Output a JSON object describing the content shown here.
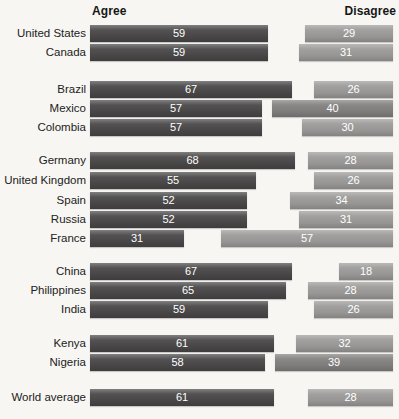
{
  "header": {
    "agree_label": "Agree",
    "disagree_label": "Disagree"
  },
  "chart_data": {
    "type": "bar",
    "orientation": "horizontal-paired",
    "unit": "percent",
    "x_max": 100,
    "legend_position": "top (column headers)",
    "grid": "off",
    "series_names": [
      "Agree",
      "Disagree"
    ],
    "groups": [
      {
        "rows": [
          {
            "label": "United States",
            "agree": 59,
            "disagree": 29,
            "disagree_dark": false
          },
          {
            "label": "Canada",
            "agree": 59,
            "disagree": 31,
            "disagree_dark": false
          }
        ]
      },
      {
        "rows": [
          {
            "label": "Brazil",
            "agree": 67,
            "disagree": 26,
            "disagree_dark": false
          },
          {
            "label": "Mexico",
            "agree": 57,
            "disagree": 40,
            "disagree_dark": true
          },
          {
            "label": "Colombia",
            "agree": 57,
            "disagree": 30,
            "disagree_dark": false
          }
        ]
      },
      {
        "rows": [
          {
            "label": "Germany",
            "agree": 68,
            "disagree": 28,
            "disagree_dark": false
          },
          {
            "label": "United Kingdom",
            "agree": 55,
            "disagree": 26,
            "disagree_dark": false
          },
          {
            "label": "Spain",
            "agree": 52,
            "disagree": 34,
            "disagree_dark": false
          },
          {
            "label": "Russia",
            "agree": 52,
            "disagree": 31,
            "disagree_dark": false
          },
          {
            "label": "France",
            "agree": 31,
            "disagree": 57,
            "disagree_dark": false
          }
        ]
      },
      {
        "rows": [
          {
            "label": "China",
            "agree": 67,
            "disagree": 18,
            "disagree_dark": false
          },
          {
            "label": "Philippines",
            "agree": 65,
            "disagree": 28,
            "disagree_dark": false
          },
          {
            "label": "India",
            "agree": 59,
            "disagree": 26,
            "disagree_dark": false
          }
        ]
      },
      {
        "rows": [
          {
            "label": "Kenya",
            "agree": 61,
            "disagree": 32,
            "disagree_dark": false
          },
          {
            "label": "Nigeria",
            "agree": 58,
            "disagree": 39,
            "disagree_dark": true
          }
        ]
      },
      {
        "rows": [
          {
            "label": "World average",
            "agree": 61,
            "disagree": 28,
            "disagree_dark": false
          }
        ]
      }
    ],
    "colors": {
      "agree_bar": "#4a4848",
      "disagree_bar": "#9c9b99",
      "disagree_bar_dark": "#828180",
      "value_text": "#ffffff",
      "label_text": "#222222",
      "background": "#f7f6f3"
    }
  }
}
